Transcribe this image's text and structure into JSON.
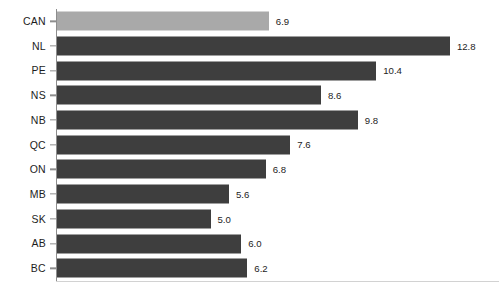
{
  "chart_data": {
    "type": "bar",
    "orientation": "horizontal",
    "title": "",
    "subtitle": "",
    "xlabel": "",
    "ylabel": "",
    "grid": false,
    "legend": null,
    "xlim": [
      0,
      14.4
    ],
    "px_per_unit": 30.7,
    "categories": [
      "CAN",
      "NL",
      "PE",
      "NS",
      "NB",
      "QC",
      "ON",
      "MB",
      "SK",
      "AB",
      "BC"
    ],
    "values": [
      6.9,
      12.8,
      10.4,
      8.6,
      9.8,
      7.6,
      6.8,
      5.6,
      5.0,
      6.0,
      6.2
    ],
    "value_labels": [
      "6.9",
      "12.8",
      "10.4",
      "8.6",
      "9.8",
      "7.6",
      "6.8",
      "5.6",
      "5.0",
      "6.0",
      "6.2"
    ],
    "bars": [
      {
        "category": "CAN",
        "value": 6.9,
        "label": "6.9",
        "highlight": true
      },
      {
        "category": "NL",
        "value": 12.8,
        "label": "12.8",
        "highlight": false
      },
      {
        "category": "PE",
        "value": 10.4,
        "label": "10.4",
        "highlight": false
      },
      {
        "category": "NS",
        "value": 8.6,
        "label": "8.6",
        "highlight": false
      },
      {
        "category": "NB",
        "value": 9.8,
        "label": "9.8",
        "highlight": false
      },
      {
        "category": "QC",
        "value": 7.6,
        "label": "7.6",
        "highlight": false
      },
      {
        "category": "ON",
        "value": 6.8,
        "label": "6.8",
        "highlight": false
      },
      {
        "category": "MB",
        "value": 5.6,
        "label": "5.6",
        "highlight": false
      },
      {
        "category": "SK",
        "value": 5.0,
        "label": "5.0",
        "highlight": false
      },
      {
        "category": "AB",
        "value": 6.0,
        "label": "6.0",
        "highlight": false
      },
      {
        "category": "BC",
        "value": 6.2,
        "label": "6.2",
        "highlight": false
      }
    ]
  },
  "colors": {
    "bar": "#3e3e3e",
    "bar_highlight": "#a9a9a9",
    "axis": "#8d8d8d",
    "baseline": "#d2d2d2",
    "text": "#1d1d1d",
    "background": "#ffffff"
  }
}
